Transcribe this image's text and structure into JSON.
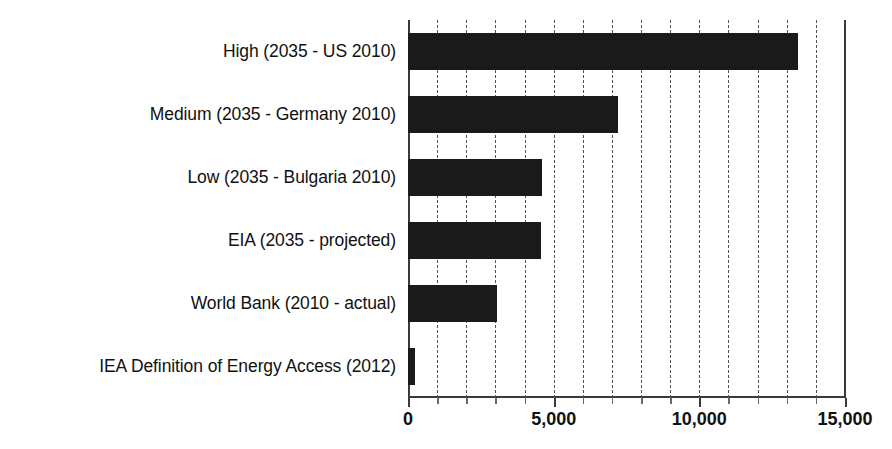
{
  "chart_data": {
    "type": "bar",
    "orientation": "horizontal",
    "title": "",
    "subtitle": "",
    "xlabel": "",
    "ylabel": "",
    "xlim": [
      0,
      15000
    ],
    "ylim": null,
    "grid": true,
    "grid_axis": "x",
    "grid_style": "dashed",
    "grid_interval": 1000,
    "legend": false,
    "legend_position": "none",
    "bar_color": "#1a1a1a",
    "axis_color": "#3a3a3a",
    "background_color": "#ffffff",
    "categories": [
      "High (2035 - US 2010)",
      "Medium (2035 - Germany 2010)",
      "Low (2035 - Bulgaria 2010)",
      "EIA (2035 - projected)",
      "World Bank (2010 - actual)",
      "IEA Definition of Energy Access (2012)"
    ],
    "values": [
      13400,
      7200,
      4600,
      4550,
      3050,
      250
    ],
    "x_tick_values": [
      0,
      5000,
      10000,
      15000
    ],
    "x_tick_labels": [
      "0",
      "5,000",
      "10,000",
      "15,000"
    ],
    "minor_tick_values": [
      1000,
      2000,
      3000,
      4000,
      6000,
      7000,
      8000,
      9000,
      11000,
      12000,
      13000,
      14000
    ]
  }
}
